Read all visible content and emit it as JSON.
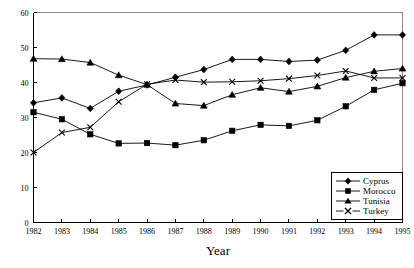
{
  "chart_data": {
    "type": "line",
    "title": "",
    "xlabel": "Year",
    "ylabel": "",
    "xlim": [
      1982,
      1995
    ],
    "ylim": [
      0,
      60
    ],
    "ytick_step": 10,
    "grid": false,
    "legend_position": "bottom-right",
    "categories": [
      "1982",
      "1983",
      "1984",
      "1985",
      "1986",
      "1987",
      "1988",
      "1989",
      "1990",
      "1991",
      "1992",
      "1993",
      "1994",
      "1995"
    ],
    "x": [
      1982,
      1983,
      1984,
      1985,
      1986,
      1987,
      1988,
      1989,
      1990,
      1991,
      1992,
      1993,
      1994,
      1995
    ],
    "yticks": [
      0,
      10,
      20,
      30,
      40,
      50,
      60
    ],
    "ytick_labels": [
      "0",
      "10",
      "20",
      "30",
      "40",
      "50",
      "60"
    ],
    "series": [
      {
        "name": "Cyprus",
        "marker": "diamond",
        "values": [
          34.2,
          35.6,
          32.6,
          37.5,
          39.3,
          41.5,
          43.7,
          46.6,
          46.6,
          46.0,
          46.4,
          49.2,
          53.6,
          53.6
        ]
      },
      {
        "name": "Morocco",
        "marker": "square",
        "values": [
          31.5,
          29.5,
          25.2,
          22.6,
          22.7,
          22.1,
          23.5,
          26.2,
          27.9,
          27.6,
          29.2,
          33.2,
          37.9,
          39.8
        ]
      },
      {
        "name": "Tunisia",
        "marker": "triangle",
        "values": [
          46.8,
          46.7,
          45.7,
          42.1,
          39.4,
          34.0,
          33.4,
          36.5,
          38.5,
          37.4,
          38.9,
          41.4,
          43.2,
          44.0
        ]
      },
      {
        "name": "Turkey",
        "marker": "x",
        "values": [
          20.0,
          25.7,
          27.2,
          34.5,
          39.5,
          40.7,
          40.1,
          40.2,
          40.5,
          41.1,
          42.0,
          43.3,
          41.3,
          41.3
        ]
      }
    ]
  },
  "legend": {
    "entries": [
      {
        "label": "Cyprus",
        "marker": "diamond"
      },
      {
        "label": "Morocco",
        "marker": "square"
      },
      {
        "label": "Tunisia",
        "marker": "triangle"
      },
      {
        "label": "Turkey",
        "marker": "x"
      }
    ]
  },
  "axis": {
    "x_title": "Year"
  }
}
